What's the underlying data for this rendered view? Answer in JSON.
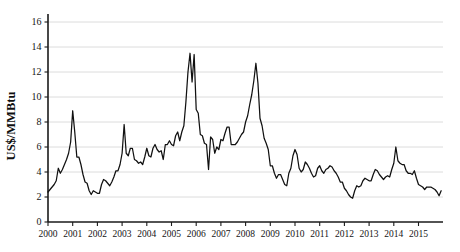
{
  "chart_data": {
    "type": "line",
    "title": "",
    "subtitle": "",
    "xlabel": "",
    "ylabel": "US$/MMBtu",
    "ylim": [
      0,
      17
    ],
    "xlim": [
      2000.0,
      2016.0
    ],
    "yticks": [
      0,
      2,
      4,
      6,
      8,
      10,
      12,
      14,
      16
    ],
    "ytick_labels": [
      "0",
      "2",
      "4",
      "6",
      "8",
      "10",
      "12",
      "14",
      "16"
    ],
    "xticks": [
      2000,
      2001,
      2002,
      2003,
      2004,
      2005,
      2006,
      2007,
      2008,
      2009,
      2010,
      2011,
      2012,
      2013,
      2014,
      2015
    ],
    "xtick_labels": [
      "2000",
      "2001",
      "2002",
      "2003",
      "2004",
      "2005",
      "2006",
      "2007",
      "2008",
      "2009",
      "2010",
      "2011",
      "2012",
      "2013",
      "2014",
      "2015"
    ],
    "grid": "horizontal",
    "legend": "none",
    "line_color": "#111111",
    "grid_color": "#d8d8d8",
    "axis_color": "#1a1a1a",
    "background_color": "#ffffff",
    "series": [
      {
        "name": "Natural gas price",
        "x": [
          2000.0,
          2000.083,
          2000.167,
          2000.25,
          2000.333,
          2000.417,
          2000.5,
          2000.583,
          2000.667,
          2000.75,
          2000.833,
          2000.917,
          2001.0,
          2001.083,
          2001.167,
          2001.25,
          2001.333,
          2001.417,
          2001.5,
          2001.583,
          2001.667,
          2001.75,
          2001.833,
          2001.917,
          2002.0,
          2002.083,
          2002.167,
          2002.25,
          2002.333,
          2002.417,
          2002.5,
          2002.583,
          2002.667,
          2002.75,
          2002.833,
          2002.917,
          2003.0,
          2003.083,
          2003.167,
          2003.25,
          2003.333,
          2003.417,
          2003.5,
          2003.583,
          2003.667,
          2003.75,
          2003.833,
          2003.917,
          2004.0,
          2004.083,
          2004.167,
          2004.25,
          2004.333,
          2004.417,
          2004.5,
          2004.583,
          2004.667,
          2004.75,
          2004.833,
          2004.917,
          2005.0,
          2005.083,
          2005.167,
          2005.25,
          2005.333,
          2005.417,
          2005.5,
          2005.583,
          2005.667,
          2005.75,
          2005.833,
          2005.917,
          2006.0,
          2006.083,
          2006.167,
          2006.25,
          2006.333,
          2006.417,
          2006.5,
          2006.583,
          2006.667,
          2006.75,
          2006.833,
          2006.917,
          2007.0,
          2007.083,
          2007.167,
          2007.25,
          2007.333,
          2007.417,
          2007.5,
          2007.583,
          2007.667,
          2007.75,
          2007.833,
          2007.917,
          2008.0,
          2008.083,
          2008.167,
          2008.25,
          2008.333,
          2008.417,
          2008.5,
          2008.583,
          2008.667,
          2008.75,
          2008.833,
          2008.917,
          2009.0,
          2009.083,
          2009.167,
          2009.25,
          2009.333,
          2009.417,
          2009.5,
          2009.583,
          2009.667,
          2009.75,
          2009.833,
          2009.917,
          2010.0,
          2010.083,
          2010.167,
          2010.25,
          2010.333,
          2010.417,
          2010.5,
          2010.583,
          2010.667,
          2010.75,
          2010.833,
          2010.917,
          2011.0,
          2011.083,
          2011.167,
          2011.25,
          2011.333,
          2011.417,
          2011.5,
          2011.583,
          2011.667,
          2011.75,
          2011.833,
          2011.917,
          2012.0,
          2012.083,
          2012.167,
          2012.25,
          2012.333,
          2012.417,
          2012.5,
          2012.583,
          2012.667,
          2012.75,
          2012.833,
          2012.917,
          2013.0,
          2013.083,
          2013.167,
          2013.25,
          2013.333,
          2013.417,
          2013.5,
          2013.583,
          2013.667,
          2013.75,
          2013.833,
          2013.917,
          2014.0,
          2014.083,
          2014.167,
          2014.25,
          2014.333,
          2014.417,
          2014.5,
          2014.583,
          2014.667,
          2014.75,
          2014.833,
          2014.917,
          2015.0,
          2015.083,
          2015.167,
          2015.25,
          2015.333,
          2015.417,
          2015.5,
          2015.583,
          2015.667,
          2015.75,
          2015.833,
          2015.917
        ],
        "values": [
          2.4,
          2.6,
          2.8,
          3.0,
          3.3,
          4.3,
          3.9,
          4.2,
          4.6,
          5.0,
          5.5,
          6.4,
          8.9,
          7.2,
          5.2,
          5.2,
          4.6,
          3.8,
          3.2,
          3.1,
          2.5,
          2.2,
          2.5,
          2.4,
          2.3,
          2.3,
          3.0,
          3.4,
          3.3,
          3.1,
          2.9,
          3.2,
          3.6,
          4.1,
          4.1,
          4.6,
          5.5,
          7.8,
          5.5,
          5.3,
          5.9,
          5.9,
          5.0,
          4.9,
          4.7,
          4.8,
          4.6,
          5.2,
          5.9,
          5.3,
          5.2,
          5.9,
          6.2,
          5.8,
          5.6,
          5.7,
          5.0,
          6.2,
          6.2,
          6.5,
          6.2,
          6.1,
          6.9,
          7.2,
          6.5,
          7.2,
          7.7,
          9.6,
          12.0,
          13.5,
          11.2,
          13.4,
          9.0,
          8.7,
          7.0,
          6.9,
          6.3,
          6.2,
          4.2,
          6.8,
          6.6,
          5.5,
          6.0,
          5.8,
          6.6,
          6.5,
          7.1,
          7.6,
          7.6,
          6.2,
          6.2,
          6.2,
          6.4,
          6.7,
          7.0,
          7.2,
          8.0,
          8.5,
          9.4,
          10.2,
          11.3,
          12.7,
          11.1,
          8.3,
          7.7,
          6.7,
          6.3,
          5.8,
          4.5,
          4.5,
          3.9,
          3.5,
          3.8,
          3.8,
          3.4,
          3.0,
          2.9,
          3.9,
          4.3,
          5.3,
          5.8,
          5.4,
          4.3,
          4.0,
          4.2,
          4.8,
          4.6,
          4.3,
          3.9,
          3.6,
          3.7,
          4.3,
          4.5,
          4.1,
          3.9,
          4.2,
          4.3,
          4.5,
          4.4,
          4.1,
          3.9,
          3.6,
          3.2,
          3.2,
          2.7,
          2.5,
          2.2,
          2.0,
          1.9,
          2.5,
          2.9,
          2.8,
          2.9,
          3.3,
          3.5,
          3.4,
          3.3,
          3.3,
          3.8,
          4.2,
          4.1,
          3.8,
          3.6,
          3.4,
          3.6,
          3.7,
          3.6,
          4.2,
          4.7,
          6.0,
          4.9,
          4.7,
          4.6,
          4.6,
          4.1,
          3.9,
          3.9,
          3.8,
          4.1,
          3.5,
          3.0,
          2.9,
          2.8,
          2.6,
          2.8,
          2.8,
          2.8,
          2.7,
          2.6,
          2.4,
          2.1,
          2.5
        ]
      }
    ]
  }
}
